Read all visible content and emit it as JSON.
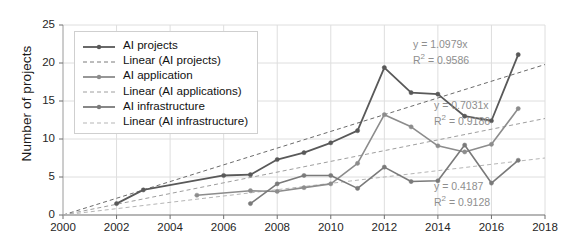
{
  "chart_data": {
    "type": "line",
    "title": "",
    "xlabel": "",
    "ylabel": "Number of projects",
    "xlim": [
      2000,
      2018
    ],
    "ylim": [
      0,
      25
    ],
    "xticks": [
      "2000",
      "2002",
      "2004",
      "2006",
      "2008",
      "2010",
      "2012",
      "2014",
      "2016",
      "2018"
    ],
    "yticks": [
      "0",
      "5",
      "10",
      "15",
      "20",
      "25"
    ],
    "grid": true,
    "legend_position": "upper-left",
    "series": [
      {
        "name": "AI projects",
        "color": "#595959",
        "style": "solid",
        "x": [
          2002,
          2003,
          2006,
          2007,
          2008,
          2009,
          2010,
          2011,
          2012,
          2013,
          2014,
          2015,
          2016,
          2017
        ],
        "values": [
          1.5,
          3.3,
          5.2,
          5.3,
          7.3,
          8.2,
          9.5,
          11.1,
          19.4,
          16.1,
          15.9,
          13.0,
          12.4,
          21.1
        ]
      },
      {
        "name": "AI application",
        "color": "#8c8c8c",
        "style": "solid",
        "x": [
          2005,
          2007,
          2008,
          2009,
          2010,
          2011,
          2012,
          2013,
          2014,
          2015,
          2016,
          2017
        ],
        "values": [
          2.6,
          3.2,
          3.1,
          3.6,
          4.1,
          6.8,
          13.2,
          11.6,
          9.1,
          8.3,
          9.3,
          14.0
        ]
      },
      {
        "name": "AI infrastructure",
        "color": "#7a7a7a",
        "style": "solid",
        "x": [
          2007,
          2008,
          2009,
          2010,
          2011,
          2012,
          2013,
          2014,
          2015,
          2016,
          2017
        ],
        "values": [
          1.5,
          4.1,
          5.2,
          5.2,
          3.5,
          6.3,
          4.4,
          4.5,
          9.2,
          4.2,
          7.2
        ]
      }
    ],
    "trendlines": [
      {
        "name": "Linear (AI projects)",
        "color": "#6b6b6b",
        "style": "dashed",
        "slope": 1.0979,
        "intercept": 0,
        "x_start": 2000,
        "x_end": 2018,
        "y_start": 0,
        "y_end": 19.8
      },
      {
        "name": "Linear (AI applications)",
        "color": "#9e9e9e",
        "style": "dashed",
        "slope": 0.7031,
        "intercept": 0,
        "x_start": 2000,
        "x_end": 2018,
        "y_start": 0,
        "y_end": 12.7
      },
      {
        "name": "Linear (AI infrastructure)",
        "color": "#b5b5b5",
        "style": "dashed",
        "slope": 0.4187,
        "intercept": 0,
        "x_start": 2000,
        "x_end": 2018,
        "y_start": 0,
        "y_end": 7.5
      }
    ],
    "annotations": [
      {
        "id": "annot-projects",
        "equation": "y = 1.0979x",
        "r2_prefix": "R",
        "r2_sup": "2",
        "r2_value": " = 0.9586",
        "x_px": 413,
        "y_px": 38
      },
      {
        "id": "annot-application",
        "equation": "y = 0.7031x",
        "r2_prefix": "R",
        "r2_sup": "2",
        "r2_value": " = 0.9186",
        "x_px": 434,
        "y_px": 99
      },
      {
        "id": "annot-infrastructure",
        "equation": "y = 0.4187",
        "r2_prefix": "R",
        "r2_sup": "2",
        "r2_value": " = 0.9128",
        "x_px": 434,
        "y_px": 180
      }
    ],
    "legend_entries": [
      {
        "label": "AI projects",
        "style": "solid",
        "color": "#595959",
        "marker": true
      },
      {
        "label": "Linear (AI projects)",
        "style": "dashed",
        "color": "#7a7a7a",
        "marker": false
      },
      {
        "label": "AI application",
        "style": "solid",
        "color": "#8c8c8c",
        "marker": true
      },
      {
        "label": "Linear (AI applications)",
        "style": "dashed",
        "color": "#9e9e9e",
        "marker": false
      },
      {
        "label": "AI infrastructure",
        "style": "solid",
        "color": "#7a7a7a",
        "marker": true
      },
      {
        "label": "Linear (AI infrastructure)",
        "style": "dashed",
        "color": "#b5b5b5",
        "marker": false
      }
    ]
  }
}
